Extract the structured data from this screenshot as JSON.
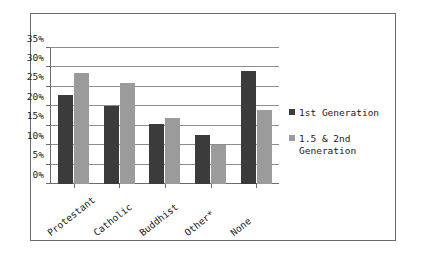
{
  "chart_data": {
    "type": "bar",
    "title": "",
    "subtitle": "",
    "xlabel": "",
    "ylabel": "",
    "categories": [
      "Protestant",
      "Catholic",
      "Buddhist",
      "Other*",
      "None"
    ],
    "series": [
      {
        "name": "1st Generation",
        "color": "#3b3b3b",
        "values": [
          23,
          20,
          15.5,
          12.5,
          29
        ]
      },
      {
        "name": "1.5 & 2nd\nGeneration",
        "color": "#9b9b9b",
        "values": [
          28.5,
          26,
          17,
          10,
          19
        ]
      }
    ],
    "ylim": [
      0,
      35
    ],
    "y_ticks": [
      "0%",
      "5%",
      "10%",
      "15%",
      "20%",
      "25%",
      "30%",
      "35%"
    ],
    "y_tick_values": [
      0,
      5,
      10,
      15,
      20,
      25,
      30,
      35
    ],
    "grid": true,
    "legend_position": "right"
  },
  "legend": {
    "entries": [
      {
        "label": "1st Generation",
        "swatch": "dark-square-marker"
      },
      {
        "label": "1.5 & 2nd\nGeneration",
        "swatch": "light-square-marker"
      }
    ]
  },
  "colors": {
    "series1": "#3b3b3b",
    "series2": "#9b9b9b",
    "gridline": "#8d8d8d",
    "axis": "#6b6b6b",
    "border": "#6b6b6b",
    "background": "#ffffff"
  }
}
